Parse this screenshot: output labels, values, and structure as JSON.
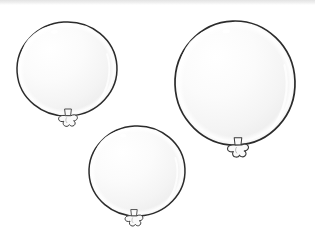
{
  "scene": {
    "title": "Three balloons line drawing",
    "width": 315,
    "height": 249,
    "background_color": "#ffffff",
    "top_edge_band_color": "#e9e9e9",
    "style": "black-and-white line art, uncolored / white balloons",
    "object_count": 3,
    "object_count_label": "3"
  },
  "palette": {
    "outline": "#2b2b2b",
    "outline_soft": "#4a4a4a",
    "balloon_fill_light": "#fdfdfd",
    "balloon_fill_mid": "#f3f3f3",
    "balloon_fill_shade": "#e6e6e6",
    "rim_highlight": "#ffffff",
    "knot_fill": "#fafafa",
    "knot_outline": "#3a3a3a",
    "specular": "#ffffff"
  },
  "balloons": [
    {
      "id": "balloon-top-left",
      "label": "Top left balloon",
      "size_label": "medium",
      "center_x": 67,
      "center_y": 69,
      "radius_x": 50,
      "radius_y": 47,
      "rotation_deg": -4,
      "knot_x": 68,
      "knot_y": 120,
      "knot_scale": 1.0,
      "specular_x": 57,
      "specular_y": 31
    },
    {
      "id": "balloon-top-right",
      "label": "Top right balloon",
      "size_label": "large",
      "center_x": 235,
      "center_y": 83,
      "radius_x": 60,
      "radius_y": 62,
      "rotation_deg": -2,
      "knot_x": 238,
      "knot_y": 150,
      "knot_scale": 1.12,
      "specular_x": 228,
      "specular_y": 29
    },
    {
      "id": "balloon-bottom-center",
      "label": "Bottom center balloon",
      "size_label": "medium-small",
      "center_x": 137,
      "center_y": 171,
      "radius_x": 48,
      "radius_y": 45,
      "rotation_deg": -3,
      "knot_x": 134,
      "knot_y": 220,
      "knot_scale": 0.95,
      "specular_x": 125,
      "specular_y": 135
    }
  ]
}
